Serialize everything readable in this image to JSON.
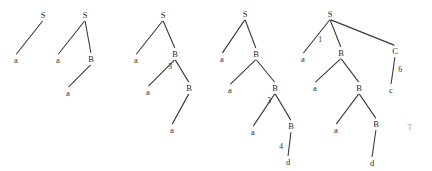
{
  "figure": {
    "title": "",
    "background_color": "#ffffff",
    "stroke_color": "#3a3a3a",
    "text_color": "#2b2b2b",
    "faint_text_color": "#9a9a9a",
    "width": 432,
    "height": 171
  },
  "corner_marker": {
    "label": "T",
    "x": 410,
    "y": 128
  },
  "trees": [
    {
      "name": "tree-1",
      "nodes": [
        {
          "id": "t1-S",
          "label": "S",
          "x": 43,
          "y": 15
        },
        {
          "id": "t1-a",
          "label": "a",
          "x": 16,
          "y": 60
        }
      ],
      "edges": [
        {
          "from": "t1-S",
          "to": "t1-a",
          "label": ""
        }
      ],
      "edge_labels": []
    },
    {
      "name": "tree-2",
      "nodes": [
        {
          "id": "t2-S",
          "label": "S",
          "x": 85,
          "y": 15
        },
        {
          "id": "t2-a1",
          "label": "a",
          "x": 58,
          "y": 60
        },
        {
          "id": "t2-B",
          "label": "B",
          "x": 91,
          "y": 59
        },
        {
          "id": "t2-a2",
          "label": "a",
          "x": 68,
          "y": 93
        }
      ],
      "edges": [
        {
          "from": "t2-S",
          "to": "t2-a1",
          "label": ""
        },
        {
          "from": "t2-S",
          "to": "t2-B",
          "label": ""
        },
        {
          "from": "t2-B",
          "to": "t2-a2",
          "label": ""
        }
      ],
      "edge_labels": []
    },
    {
      "name": "tree-3",
      "nodes": [
        {
          "id": "t3-S",
          "label": "S",
          "x": 163,
          "y": 15
        },
        {
          "id": "t3-a1",
          "label": "a",
          "x": 136,
          "y": 60
        },
        {
          "id": "t3-B1",
          "label": "B",
          "x": 175,
          "y": 54
        },
        {
          "id": "t3-a2",
          "label": "a",
          "x": 148,
          "y": 92
        },
        {
          "id": "t3-B2",
          "label": "B",
          "x": 189,
          "y": 88
        },
        {
          "id": "t3-a3",
          "label": "a",
          "x": 172,
          "y": 130
        }
      ],
      "edges": [
        {
          "from": "t3-S",
          "to": "t3-a1",
          "label": ""
        },
        {
          "from": "t3-S",
          "to": "t3-B1",
          "label": ""
        },
        {
          "from": "t3-B1",
          "to": "t3-a2",
          "label": ""
        },
        {
          "from": "t3-B1",
          "to": "t3-B2",
          "label": ""
        },
        {
          "from": "t3-B2",
          "to": "t3-a3",
          "label": ""
        }
      ],
      "edge_labels": [
        {
          "label": "3",
          "x": 170,
          "y": 67
        }
      ]
    },
    {
      "name": "tree-4",
      "nodes": [
        {
          "id": "t4-S",
          "label": "S",
          "x": 245,
          "y": 14
        },
        {
          "id": "t4-a1",
          "label": "a",
          "x": 222,
          "y": 59
        },
        {
          "id": "t4-B1",
          "label": "B",
          "x": 256,
          "y": 54
        },
        {
          "id": "t4-a2",
          "label": "a",
          "x": 230,
          "y": 90
        },
        {
          "id": "t4-B2",
          "label": "B",
          "x": 275,
          "y": 88
        },
        {
          "id": "t4-a3",
          "label": "a",
          "x": 253,
          "y": 132
        },
        {
          "id": "t4-B3",
          "label": "B",
          "x": 291,
          "y": 126
        },
        {
          "id": "t4-d",
          "label": "d",
          "x": 288,
          "y": 162
        }
      ],
      "edges": [
        {
          "from": "t4-S",
          "to": "t4-a1",
          "label": ""
        },
        {
          "from": "t4-S",
          "to": "t4-B1",
          "label": ""
        },
        {
          "from": "t4-B1",
          "to": "t4-a2",
          "label": ""
        },
        {
          "from": "t4-B1",
          "to": "t4-B2",
          "label": ""
        },
        {
          "from": "t4-B2",
          "to": "t4-a3",
          "label": ""
        },
        {
          "from": "t4-B2",
          "to": "t4-B3",
          "label": ""
        },
        {
          "from": "t4-B3",
          "to": "t4-d",
          "label": ""
        }
      ],
      "edge_labels": [
        {
          "label": "3",
          "x": 269,
          "y": 101
        },
        {
          "label": "4",
          "x": 281,
          "y": 147
        }
      ]
    },
    {
      "name": "tree-5",
      "nodes": [
        {
          "id": "t5-S",
          "label": "S",
          "x": 330,
          "y": 14
        },
        {
          "id": "t5-a1",
          "label": "a",
          "x": 303,
          "y": 59
        },
        {
          "id": "t5-B1",
          "label": "B",
          "x": 341,
          "y": 53
        },
        {
          "id": "t5-C",
          "label": "C",
          "x": 395,
          "y": 51
        },
        {
          "id": "t5-c",
          "label": "c",
          "x": 391,
          "y": 90
        },
        {
          "id": "t5-a2",
          "label": "a",
          "x": 315,
          "y": 88
        },
        {
          "id": "t5-B2",
          "label": "B",
          "x": 359,
          "y": 88
        },
        {
          "id": "t5-a3",
          "label": "a",
          "x": 336,
          "y": 130
        },
        {
          "id": "t5-B3",
          "label": "B",
          "x": 376,
          "y": 124
        },
        {
          "id": "t5-d",
          "label": "d",
          "x": 372,
          "y": 163
        }
      ],
      "edges": [
        {
          "from": "t5-S",
          "to": "t5-a1",
          "label": ""
        },
        {
          "from": "t5-S",
          "to": "t5-B1",
          "label": ""
        },
        {
          "from": "t5-S",
          "to": "t5-C",
          "label": ""
        },
        {
          "from": "t5-C",
          "to": "t5-c",
          "label": ""
        },
        {
          "from": "t5-B1",
          "to": "t5-a2",
          "label": ""
        },
        {
          "from": "t5-B1",
          "to": "t5-B2",
          "label": ""
        },
        {
          "from": "t5-B2",
          "to": "t5-a3",
          "label": ""
        },
        {
          "from": "t5-B2",
          "to": "t5-B3",
          "label": ""
        },
        {
          "from": "t5-B3",
          "to": "t5-d",
          "label": ""
        }
      ],
      "edge_labels": [
        {
          "label": "1",
          "x": 320,
          "y": 40
        },
        {
          "label": "6",
          "x": 400,
          "y": 70
        }
      ]
    }
  ]
}
